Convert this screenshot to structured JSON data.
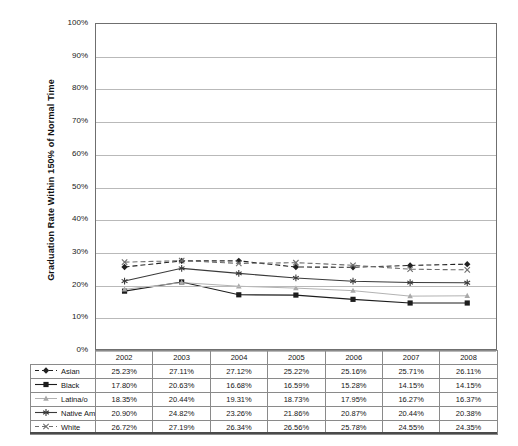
{
  "chart_data": {
    "type": "line",
    "title": "",
    "xlabel": "",
    "ylabel": "Graduation Rate Within 150% of Normal Time",
    "ylim": [
      0,
      100
    ],
    "y_unit": "%",
    "grid": true,
    "legend_position": "table-row-headers",
    "categories": [
      "2002",
      "2003",
      "2004",
      "2005",
      "2006",
      "2007",
      "2008"
    ],
    "y_ticks": [
      "0%",
      "10%",
      "20%",
      "30%",
      "40%",
      "50%",
      "60%",
      "70%",
      "80%",
      "90%",
      "100%"
    ],
    "y_tick_values": [
      0,
      10,
      20,
      30,
      40,
      50,
      60,
      70,
      80,
      90,
      100
    ],
    "series": [
      {
        "name": "Asian",
        "marker": "diamond",
        "line_style": "dashed",
        "color": "#222222",
        "values": [
          25.23,
          27.11,
          27.12,
          25.22,
          25.16,
          25.71,
          26.11
        ],
        "labels": [
          "25.23%",
          "27.11%",
          "27.12%",
          "25.22%",
          "25.16%",
          "25.71%",
          "26.11%"
        ]
      },
      {
        "name": "Black",
        "marker": "square",
        "line_style": "solid",
        "color": "#1c1c1c",
        "values": [
          17.8,
          20.63,
          16.68,
          16.59,
          15.28,
          14.15,
          14.15
        ],
        "labels": [
          "17.80%",
          "20.63%",
          "16.68%",
          "16.59%",
          "15.28%",
          "14.15%",
          "14.15%"
        ]
      },
      {
        "name": "Latina/o",
        "marker": "triangle",
        "line_style": "solid",
        "color": "#a9a9a9",
        "values": [
          18.35,
          20.44,
          19.31,
          18.73,
          17.95,
          16.27,
          16.37
        ],
        "labels": [
          "18.35%",
          "20.44%",
          "19.31%",
          "18.73%",
          "17.95%",
          "16.27%",
          "16.37%"
        ]
      },
      {
        "name": "Native American",
        "marker": "asterisk",
        "line_style": "solid",
        "color": "#3a3a3a",
        "values": [
          20.9,
          24.82,
          23.26,
          21.86,
          20.87,
          20.44,
          20.38
        ],
        "labels": [
          "20.90%",
          "24.82%",
          "23.26%",
          "21.86%",
          "20.87%",
          "20.44%",
          "20.38%"
        ]
      },
      {
        "name": "White",
        "marker": "x",
        "line_style": "dashed",
        "color": "#6e6e6e",
        "values": [
          26.72,
          27.19,
          26.34,
          26.56,
          25.78,
          24.55,
          24.35
        ],
        "labels": [
          "26.72%",
          "27.19%",
          "26.34%",
          "26.56%",
          "25.78%",
          "24.55%",
          "24.35%"
        ]
      }
    ]
  },
  "table": {
    "header_row": [
      "",
      "2002",
      "2003",
      "2004",
      "2005",
      "2006",
      "2007",
      "2008"
    ],
    "rows": [
      {
        "label": "Asian",
        "cells": [
          "25.23%",
          "27.11%",
          "27.12%",
          "25.22%",
          "25.16%",
          "25.71%",
          "26.11%"
        ]
      },
      {
        "label": "Black",
        "cells": [
          "17.80%",
          "20.63%",
          "16.68%",
          "16.59%",
          "15.28%",
          "14.15%",
          "14.15%"
        ]
      },
      {
        "label": "Latina/o",
        "cells": [
          "18.35%",
          "20.44%",
          "19.31%",
          "18.73%",
          "17.95%",
          "16.27%",
          "16.37%"
        ]
      },
      {
        "label": "Native American",
        "cells": [
          "20.90%",
          "24.82%",
          "23.26%",
          "21.86%",
          "20.87%",
          "20.44%",
          "20.38%"
        ]
      },
      {
        "label": "White",
        "cells": [
          "26.72%",
          "27.19%",
          "26.34%",
          "26.56%",
          "25.78%",
          "24.55%",
          "24.35%"
        ]
      }
    ]
  },
  "colors": {
    "axis": "#6f6f6f",
    "gridline": "#b9b9b9",
    "table_border": "#8a8a8a",
    "text": "#151515",
    "rule": "#4a4a4a",
    "background": "#ffffff"
  }
}
